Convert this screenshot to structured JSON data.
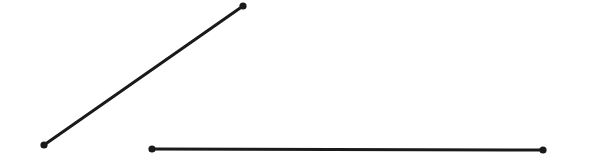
{
  "figure": {
    "width": 589,
    "height": 165,
    "background_color": "#ffffff",
    "ink_color": "#1a1a1a"
  },
  "chart_data": {
    "type": "scatter",
    "title": "",
    "subtitle": "",
    "xlabel": "",
    "ylabel": "",
    "grid": false,
    "legend": null,
    "axes_visible": false,
    "tick_labels": [],
    "annotations": [],
    "xlim": [
      0,
      589
    ],
    "ylim": [
      0,
      165
    ],
    "series": [
      {
        "name": "diagonal-segment",
        "kind": "segment",
        "color": "#1a1a1a",
        "stroke_width": 3,
        "endpoint_radius": 3.6,
        "x": [
          44,
          243
        ],
        "y": [
          145,
          6
        ],
        "points": [
          {
            "label": "lower-left endpoint",
            "x": 44,
            "y": 145
          },
          {
            "label": "upper-right endpoint",
            "x": 243,
            "y": 6
          }
        ]
      },
      {
        "name": "horizontal-segment",
        "kind": "segment",
        "color": "#1a1a1a",
        "stroke_width": 3,
        "endpoint_radius": 3.6,
        "x": [
          152,
          543
        ],
        "y": [
          149,
          150
        ],
        "points": [
          {
            "label": "left endpoint",
            "x": 152,
            "y": 149
          },
          {
            "label": "right endpoint",
            "x": 543,
            "y": 150
          }
        ]
      }
    ]
  }
}
